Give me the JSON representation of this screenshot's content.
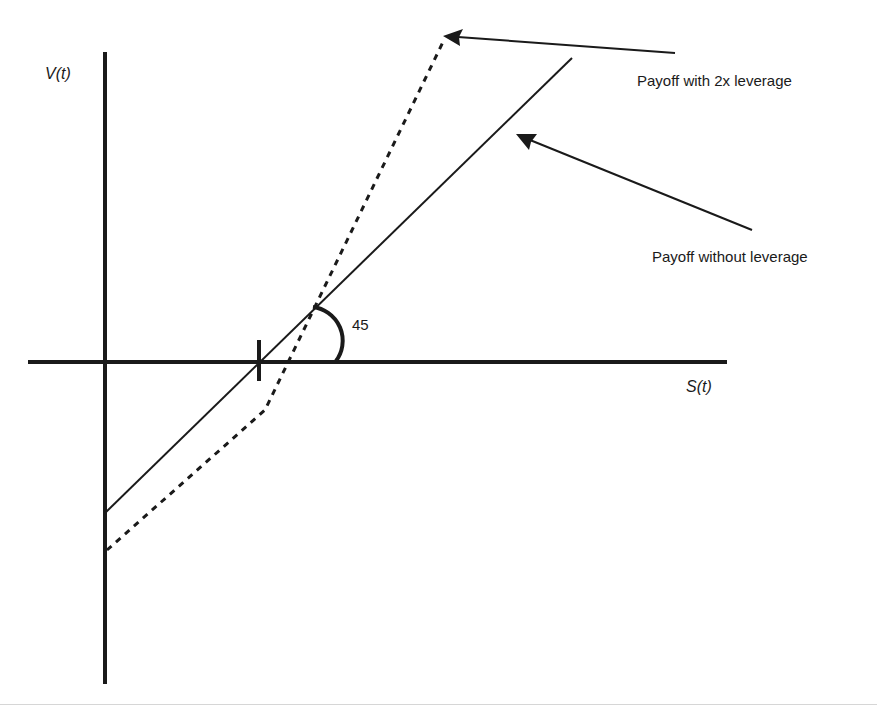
{
  "diagram": {
    "y_axis_label": "V(t)",
    "x_axis_label": "S(t)",
    "angle_label": "45",
    "annotations": [
      {
        "id": "leveraged",
        "text": "Payoff with 2x leverage"
      },
      {
        "id": "unleveraged",
        "text": "Payoff without leverage"
      }
    ],
    "lines": [
      {
        "name": "payoff-without-leverage",
        "style": "solid",
        "slope_deg": 45
      },
      {
        "name": "payoff-with-2x-leverage",
        "style": "dashed"
      }
    ],
    "colors": {
      "ink": "#1a1a1a",
      "background": "#ffffff"
    }
  }
}
